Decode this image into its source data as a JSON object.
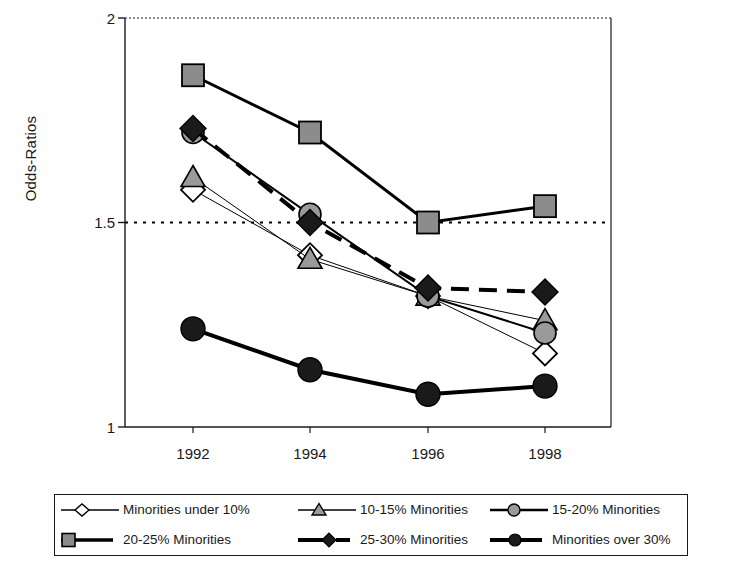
{
  "chart_data": {
    "type": "line",
    "title": "",
    "xlabel": "",
    "ylabel": "Odds-Ratios",
    "x": [
      1992,
      1994,
      1996,
      1998
    ],
    "categories": [
      "1992",
      "1994",
      "1996",
      "1998"
    ],
    "ylim": [
      1,
      2
    ],
    "yticks": [
      1,
      1.5,
      2
    ],
    "ytick_labels": [
      "1",
      "1.5",
      "2"
    ],
    "grid": false,
    "reference_line": {
      "value": 1.5,
      "style": "dotted",
      "color": "#000000"
    },
    "legend_position": "bottom",
    "series": [
      {
        "name": "Minorities under 10%",
        "marker": "diamond-open",
        "marker_fill": "#ffffff",
        "marker_stroke": "#000000",
        "line_style": "solid",
        "line_width": 1,
        "line_color": "#000000",
        "values": [
          1.58,
          1.42,
          1.32,
          1.18
        ]
      },
      {
        "name": "10-15% Minorities",
        "marker": "triangle",
        "marker_fill": "#9a9a9a",
        "marker_stroke": "#000000",
        "line_style": "solid",
        "line_width": 1,
        "line_color": "#000000",
        "values": [
          1.61,
          1.41,
          1.32,
          1.26
        ]
      },
      {
        "name": "15-20% Minorities",
        "marker": "circle",
        "marker_fill": "#9a9a9a",
        "marker_stroke": "#000000",
        "line_style": "solid",
        "line_width": 2,
        "line_color": "#000000",
        "values": [
          1.72,
          1.52,
          1.32,
          1.23
        ]
      },
      {
        "name": "20-25% Minorities",
        "marker": "square",
        "marker_fill": "#8c8c8c",
        "marker_stroke": "#000000",
        "line_style": "solid",
        "line_width": 3,
        "line_color": "#000000",
        "values": [
          1.86,
          1.72,
          1.5,
          1.54
        ]
      },
      {
        "name": "25-30% Minorities",
        "marker": "diamond-filled",
        "marker_fill": "#1a1a1a",
        "marker_stroke": "#000000",
        "line_style": "dashed",
        "line_width": 4,
        "line_color": "#000000",
        "values": [
          1.73,
          1.5,
          1.34,
          1.33
        ]
      },
      {
        "name": "Minorities over 30%",
        "marker": "circle-filled",
        "marker_fill": "#1a1a1a",
        "marker_stroke": "#000000",
        "line_style": "solid",
        "line_width": 4,
        "line_color": "#000000",
        "values": [
          1.24,
          1.14,
          1.08,
          1.1
        ]
      }
    ]
  },
  "axes": {
    "y_label": "Odds-Ratios",
    "y_ticks": [
      "2",
      "1.5",
      "1"
    ],
    "x_ticks": [
      "1992",
      "1994",
      "1996",
      "1998"
    ]
  },
  "legend": {
    "items": [
      {
        "label": "Minorities under 10%",
        "key": "diamond-open-key"
      },
      {
        "label": "10-15% Minorities",
        "key": "triangle-key"
      },
      {
        "label": "15-20% Minorities",
        "key": "circle-gray-key"
      },
      {
        "label": "20-25% Minorities",
        "key": "square-gray-key"
      },
      {
        "label": "25-30% Minorities",
        "key": "diamond-filled-dashed-key"
      },
      {
        "label": "Minorities over 30%",
        "key": "circle-black-key"
      }
    ]
  },
  "colors": {
    "axis": "#1a1a1a",
    "marker_gray": "#9a9a9a",
    "marker_dark": "#1a1a1a",
    "background": "#ffffff"
  }
}
